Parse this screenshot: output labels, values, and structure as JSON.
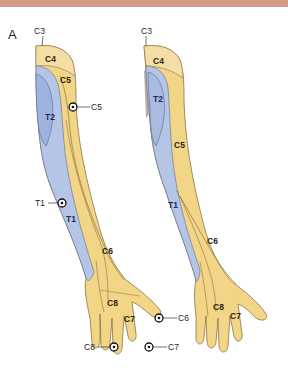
{
  "colors": {
    "banner": "#d49a86",
    "cervical": "#f3d588",
    "cervical_light": "#f5dea6",
    "thoracic": "#b5c5e6",
    "thoracic_dark": "#8fa6d6",
    "outline": "#6b5a3a",
    "skin_gray": "#b9aba3"
  },
  "figure": {
    "panel_label": "A",
    "left_arm": {
      "labels": {
        "c3": "C3",
        "c4": "C4",
        "c5_upper": "C5",
        "t2": "T2",
        "t1": "T1",
        "c6": "C6",
        "c8": "C8",
        "c7": "C7"
      },
      "test_points": {
        "c5": "C5",
        "t1": "T1",
        "c6": "C6",
        "c8": "C8",
        "c7": "C7"
      }
    },
    "right_arm": {
      "labels": {
        "c3": "C3",
        "c4": "C4",
        "t2": "T2",
        "c5": "C5",
        "t1": "T1",
        "c6": "C6",
        "c8": "C8",
        "c7": "C7"
      }
    }
  }
}
